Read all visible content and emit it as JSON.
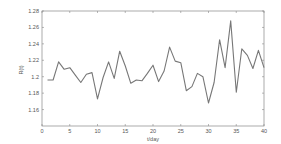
{
  "chart_data": {
    "type": "line",
    "title": "",
    "xlabel": "t/day",
    "ylabel": "R(t)",
    "xlim": [
      0,
      40
    ],
    "ylim": [
      1.14,
      1.28
    ],
    "x_ticks": [
      0,
      5,
      10,
      15,
      20,
      25,
      30,
      35,
      40
    ],
    "x_tick_labels": [
      "0",
      "5",
      "10",
      "15",
      "20",
      "25",
      "30",
      "35",
      "40"
    ],
    "y_ticks": [
      1.16,
      1.18,
      1.2,
      1.22,
      1.24,
      1.26,
      1.28
    ],
    "y_tick_labels": [
      "1.16",
      "1.18",
      "1.2",
      "1.22",
      "1.24",
      "1.26",
      "1.28"
    ],
    "grid": false,
    "legend": null,
    "series": [
      {
        "name": "R(t)",
        "color": "#777777",
        "x": [
          1,
          2,
          3,
          4,
          5,
          6,
          7,
          8,
          9,
          10,
          11,
          12,
          13,
          14,
          15,
          16,
          17,
          18,
          19,
          20,
          21,
          22,
          23,
          24,
          25,
          26,
          27,
          28,
          29,
          30,
          31,
          32,
          33,
          34,
          35,
          36,
          37,
          38,
          39,
          40
        ],
        "values": [
          1.196,
          1.196,
          1.218,
          1.209,
          1.211,
          1.202,
          1.193,
          1.203,
          1.205,
          1.173,
          1.199,
          1.218,
          1.198,
          1.231,
          1.213,
          1.192,
          1.196,
          1.195,
          1.204,
          1.214,
          1.194,
          1.207,
          1.236,
          1.219,
          1.217,
          1.183,
          1.188,
          1.204,
          1.2,
          1.168,
          1.193,
          1.245,
          1.211,
          1.268,
          1.181,
          1.234,
          1.226,
          1.21,
          1.232,
          1.211
        ]
      }
    ]
  }
}
